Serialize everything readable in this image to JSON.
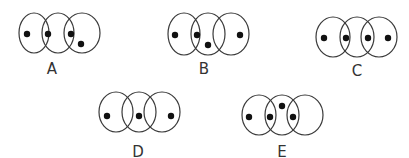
{
  "figure": {
    "colors": {
      "line": "#3a3a3a",
      "dot": "#111111",
      "background": "#ffffff"
    },
    "diagrams": [
      {
        "label": "A",
        "label_pos": [
          52,
          74
        ],
        "ellipses": [
          [
            34,
            33,
            15,
            20
          ],
          [
            58,
            33,
            16,
            20
          ],
          [
            82,
            33,
            18,
            20
          ]
        ],
        "dots": [
          [
            27,
            34
          ],
          [
            48,
            34
          ],
          [
            71,
            34
          ],
          [
            81,
            44
          ]
        ]
      },
      {
        "label": "B",
        "label_pos": [
          204,
          74
        ],
        "ellipses": [
          [
            184,
            34,
            16,
            21
          ],
          [
            208,
            34,
            17,
            21
          ],
          [
            231,
            34,
            18,
            21
          ]
        ],
        "dots": [
          [
            175,
            35
          ],
          [
            197,
            35
          ],
          [
            208,
            45
          ],
          [
            240,
            35
          ]
        ]
      },
      {
        "label": "C",
        "label_pos": [
          357,
          76
        ],
        "ellipses": [
          [
            333,
            37,
            17,
            20
          ],
          [
            357,
            37,
            17,
            20
          ],
          [
            379,
            37,
            18,
            20
          ]
        ],
        "dots": [
          [
            324,
            38
          ],
          [
            346,
            38
          ],
          [
            368,
            38
          ],
          [
            388,
            38
          ]
        ]
      },
      {
        "label": "D",
        "label_pos": [
          138,
          157
        ],
        "ellipses": [
          [
            116,
            112,
            17,
            20
          ],
          [
            139,
            112,
            17,
            20
          ],
          [
            162,
            112,
            18,
            20
          ]
        ],
        "dots": [
          [
            107,
            116
          ],
          [
            139,
            116
          ],
          [
            171,
            116
          ]
        ]
      },
      {
        "label": "E",
        "label_pos": [
          282,
          157
        ],
        "ellipses": [
          [
            259,
            115,
            17,
            20
          ],
          [
            282,
            115,
            17,
            20
          ],
          [
            305,
            115,
            18,
            20
          ]
        ],
        "dots": [
          [
            249,
            117
          ],
          [
            270,
            117
          ],
          [
            282,
            106
          ],
          [
            293,
            117
          ]
        ]
      }
    ]
  }
}
